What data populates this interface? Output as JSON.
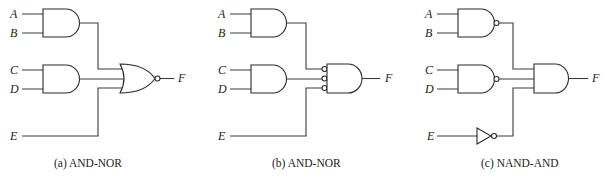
{
  "figure": {
    "panels": [
      {
        "id": "a",
        "caption": "(a) AND-NOR",
        "inputs": [
          "A",
          "B",
          "C",
          "D",
          "E"
        ],
        "output": "F",
        "gates": [
          "AND",
          "AND",
          "NOR"
        ]
      },
      {
        "id": "b",
        "caption": "(b) AND-NOR",
        "inputs": [
          "A",
          "B",
          "C",
          "D",
          "E"
        ],
        "output": "F",
        "gates": [
          "AND",
          "AND",
          "AND with inverted inputs"
        ]
      },
      {
        "id": "c",
        "caption": "(c) NAND-AND",
        "inputs": [
          "A",
          "B",
          "C",
          "D",
          "E"
        ],
        "output": "F",
        "gates": [
          "NAND",
          "NAND",
          "NOT",
          "AND"
        ]
      }
    ]
  }
}
